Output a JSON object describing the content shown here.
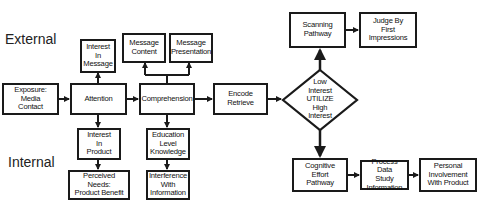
{
  "labels": {
    "external": "External",
    "internal": "Internal"
  },
  "nodes": {
    "exposure": "Exposure:\nMedia\nContact",
    "attention": "Attention",
    "comprehension": "Comprehension",
    "encode": "Encode\nRetrieve",
    "interest_message": "Interest\nIn\nMessage",
    "message_content": "Message\nContent",
    "message_presentation": "Message\nPresentation",
    "interest_product": "Interest\nIn\nProduct",
    "education": "Education\nLevel\nKnowledge",
    "perceived_needs": "Perceived Needs:\nProduct Benefit",
    "interference": "Interference\nWith\nInformation",
    "decision": "Low\nInterest\nUTILIZE\nHigh\nInterest",
    "scanning": "Scanning\nPathway",
    "judge": "Judge By\nFirst\nImpressions",
    "cognitive": "Cognitive\nEffort\nPathway",
    "process_data": "Process Data\nStudy\nInformation",
    "personal": "Personal\nInvolvement\nWith Product"
  },
  "colors": {
    "stroke": "#1a1a1a",
    "background": "#ffffff"
  }
}
